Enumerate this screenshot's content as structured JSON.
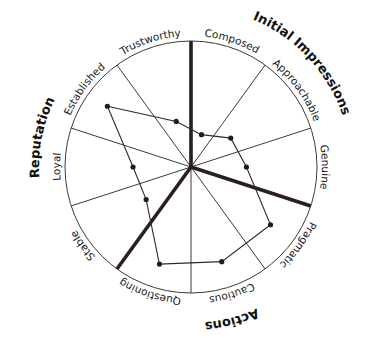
{
  "chart_data": {
    "type": "radar",
    "title": "",
    "center": [
      191,
      167
    ],
    "radius": 126,
    "categories": [
      "Composed",
      "Approachable",
      "Genuine",
      "Pragmatic",
      "Cautious",
      "Questioning",
      "Stable",
      "Loyal",
      "Established",
      "Trustworthy"
    ],
    "category_angles_deg": [
      18,
      54,
      90,
      126,
      162,
      198,
      234,
      270,
      306,
      342
    ],
    "series": [
      {
        "name": "Profile",
        "values": [
          0.27,
          0.39,
          0.44,
          0.78,
          0.79,
          0.81,
          0.44,
          0.46,
          0.82,
          0.38
        ]
      }
    ],
    "rlim": [
      0,
      1
    ],
    "spoke_angles_deg": [
      0,
      36,
      72,
      108,
      144,
      180,
      216,
      252,
      288,
      324
    ],
    "group_dividers_deg": [
      0,
      108,
      216
    ],
    "groups": [
      {
        "name": "Initial Impressions",
        "categories": [
          "Composed",
          "Approachable",
          "Genuine"
        ],
        "label_angle_deg": 47,
        "label_radius": 160
      },
      {
        "name": "Actions",
        "categories": [
          "Pragmatic",
          "Cautious",
          "Questioning"
        ],
        "label_angle_deg": 165,
        "label_radius": 156
      },
      {
        "name": "Reputation",
        "categories": [
          "Stable",
          "Loyal",
          "Established",
          "Trustworthy"
        ],
        "label_angle_deg": 281,
        "label_radius": 152
      }
    ],
    "label_radius": 131,
    "colors": {
      "line": "#2b2b2b",
      "spoke": "#3a3a3a",
      "divider": "#2a1f1c",
      "point": "#1e1e1e"
    }
  }
}
